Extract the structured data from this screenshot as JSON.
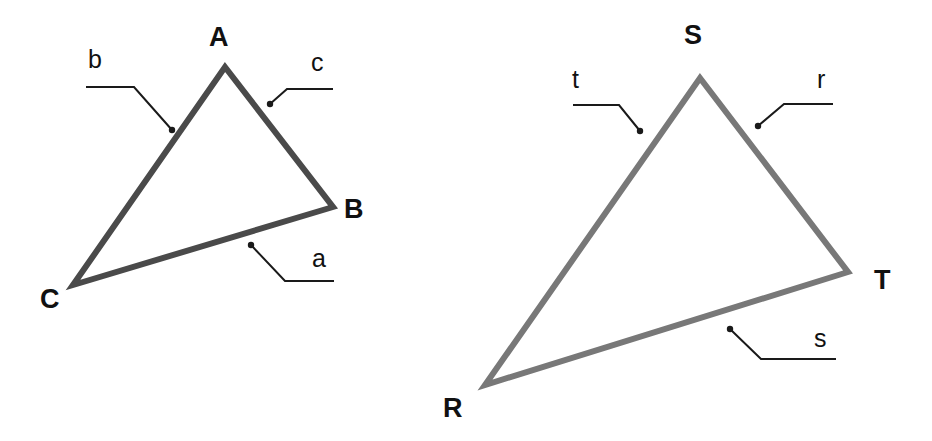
{
  "figure": {
    "background_color": "#ffffff",
    "width": 932,
    "height": 441
  },
  "triangles": [
    {
      "id": "triangle-abc",
      "name": "Triangle ABC",
      "stroke_color": "#4a4a4a",
      "stroke_width": 6,
      "vertices": [
        {
          "label": "A",
          "x": 225,
          "y": 67,
          "label_x": 209,
          "label_y": 46
        },
        {
          "label": "B",
          "x": 333,
          "y": 207,
          "label_x": 344,
          "label_y": 218
        },
        {
          "label": "C",
          "x": 73,
          "y": 285,
          "label_x": 40,
          "label_y": 308
        }
      ],
      "sides": [
        {
          "label": "a",
          "label_x": 312,
          "label_y": 267,
          "leader": {
            "dot_x": 251,
            "dot_y": 245,
            "elbow_x": 285,
            "elbow_y": 281,
            "end_x": 334,
            "end_y": 281
          }
        },
        {
          "label": "b",
          "label_x": 88,
          "label_y": 68,
          "leader": {
            "dot_x": 172,
            "dot_y": 130,
            "elbow_x": 134,
            "elbow_y": 87,
            "end_x": 86,
            "end_y": 87
          }
        },
        {
          "label": "c",
          "label_x": 311,
          "label_y": 71,
          "leader": {
            "dot_x": 270,
            "dot_y": 104,
            "elbow_x": 287,
            "elbow_y": 89,
            "end_x": 333,
            "end_y": 89
          }
        }
      ]
    },
    {
      "id": "triangle-rst",
      "name": "Triangle RST",
      "stroke_color": "#787878",
      "stroke_width": 6,
      "vertices": [
        {
          "label": "S",
          "x": 700,
          "y": 78,
          "label_x": 684,
          "label_y": 44
        },
        {
          "label": "T",
          "x": 848,
          "y": 272,
          "label_x": 874,
          "label_y": 289
        },
        {
          "label": "R",
          "x": 485,
          "y": 385,
          "label_x": 443,
          "label_y": 417
        }
      ],
      "sides": [
        {
          "label": "r",
          "label_x": 817,
          "label_y": 88,
          "leader": {
            "dot_x": 758,
            "dot_y": 126,
            "elbow_x": 784,
            "elbow_y": 104,
            "end_x": 833,
            "end_y": 104
          }
        },
        {
          "label": "s",
          "label_x": 814,
          "label_y": 347,
          "leader": {
            "dot_x": 730,
            "dot_y": 329,
            "elbow_x": 761,
            "elbow_y": 359,
            "end_x": 836,
            "end_y": 359
          }
        },
        {
          "label": "t",
          "label_x": 572,
          "label_y": 88,
          "leader": {
            "dot_x": 640,
            "dot_y": 131,
            "elbow_x": 619,
            "elbow_y": 105,
            "end_x": 573,
            "end_y": 105
          }
        }
      ]
    }
  ],
  "leader_line": {
    "color": "#1a1a1a",
    "width": 2,
    "dot_radius": 3.2
  }
}
